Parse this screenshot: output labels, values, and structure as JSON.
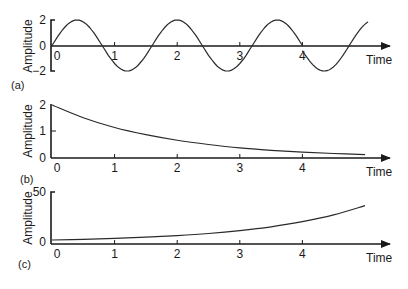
{
  "chart_data": [
    {
      "type": "line",
      "panel_label": "(a)",
      "title": "",
      "xlabel": "Time",
      "ylabel": "Amplitude",
      "xlim": [
        0,
        5.4
      ],
      "ylim": [
        -2,
        2
      ],
      "x_ticks": [
        "0",
        "1",
        "2",
        "3",
        "4"
      ],
      "y_ticks": [
        "2",
        "0",
        "−2"
      ],
      "grid": false,
      "legend": null,
      "description": "Sinusoid, amplitude 2, period ~1.6, with a 180-degree phase discontinuity at t=4",
      "series": [
        {
          "name": "segment 1 (t=0..4)",
          "x": [
            0,
            0.4,
            0.8,
            1.2,
            1.6,
            2.0,
            2.4,
            2.8,
            3.2,
            3.6,
            4.0
          ],
          "y": [
            0,
            2,
            0,
            -2,
            0,
            2,
            0,
            -2,
            0,
            2,
            0
          ]
        },
        {
          "name": "segment 2 (t=4..5.05, phase reversed)",
          "x": [
            4.0,
            4.4,
            4.8,
            5.05
          ],
          "y": [
            -0.4,
            -2,
            0,
            1.6
          ]
        }
      ]
    },
    {
      "type": "line",
      "panel_label": "(b)",
      "title": "",
      "xlabel": "Time",
      "ylabel": "Amplitude",
      "xlim": [
        0,
        5.4
      ],
      "ylim": [
        0,
        2
      ],
      "x_ticks": [
        "0",
        "1",
        "2",
        "3",
        "4"
      ],
      "y_ticks": [
        "2",
        "1",
        "0"
      ],
      "grid": false,
      "legend": null,
      "description": "Exponential decay, approx 2*exp(-0.55 t)",
      "series": [
        {
          "name": "decay",
          "x": [
            0,
            0.5,
            1,
            1.5,
            2,
            2.5,
            3,
            3.5,
            4,
            4.5,
            5
          ],
          "y": [
            2.0,
            1.52,
            1.15,
            0.88,
            0.67,
            0.51,
            0.38,
            0.29,
            0.22,
            0.17,
            0.13
          ]
        }
      ]
    },
    {
      "type": "line",
      "panel_label": "(c)",
      "title": "",
      "xlabel": "Time",
      "ylabel": "Amplitude",
      "xlim": [
        0,
        5.4
      ],
      "ylim": [
        0,
        50
      ],
      "x_ticks": [
        "0",
        "1",
        "2",
        "3",
        "4"
      ],
      "y_ticks": [
        "50",
        "0"
      ],
      "grid": false,
      "legend": null,
      "description": "Exponential growth, approx 2*exp(0.58 t)",
      "series": [
        {
          "name": "growth",
          "x": [
            0,
            0.5,
            1,
            1.5,
            2,
            2.5,
            3,
            3.5,
            4,
            4.5,
            5
          ],
          "y": [
            2.0,
            2.7,
            3.6,
            4.8,
            6.4,
            8.5,
            11.4,
            15.2,
            20.3,
            27.1,
            36.3
          ]
        }
      ]
    }
  ]
}
